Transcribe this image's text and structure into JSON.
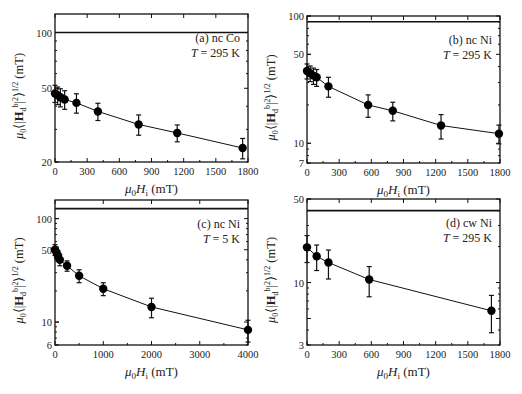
{
  "figure": {
    "ylabel": "μ0⟨|Hd^b|²⟩^1/2 (mT)",
    "xlabel": "μ0Hi (mT)"
  },
  "chart_data": [
    {
      "id": "a",
      "type": "line",
      "annotation_line1": "(a) nc Co",
      "annotation_line2": "T = 295 K",
      "xlabel": "μ0Hi (mT)",
      "ylabel": "μ0⟨|Hd^b|²⟩^1/2 (mT)",
      "yscale": "log",
      "xlim": [
        0,
        1800
      ],
      "ylim": [
        20,
        100
      ],
      "top_line_value": 100,
      "xticks": [
        0,
        300,
        600,
        900,
        1200,
        1500,
        1800
      ],
      "yticks": [
        20,
        50,
        100
      ],
      "x": [
        0,
        25,
        50,
        90,
        200,
        400,
        780,
        1140,
        1750
      ],
      "values": [
        46.9,
        45.8,
        44.7,
        43.5,
        41.7,
        37.5,
        31.9,
        28.7,
        23.8
      ],
      "err": [
        5,
        5,
        5,
        5,
        5,
        4,
        4,
        3,
        3
      ],
      "grid": false
    },
    {
      "id": "b",
      "type": "line",
      "annotation_line1": "(b) nc Ni",
      "annotation_line2": "T = 295 K",
      "xlabel": "μ0Hi (mT)",
      "ylabel": "μ0⟨|Hd^b|²⟩^1/2 (mT)",
      "yscale": "log",
      "xlim": [
        0,
        1800
      ],
      "ylim": [
        7,
        100
      ],
      "top_line_value": 90,
      "xticks": [
        0,
        300,
        600,
        900,
        1200,
        1500,
        1800
      ],
      "yticks": [
        7,
        10,
        50,
        100
      ],
      "x": [
        0,
        30,
        60,
        90,
        200,
        570,
        800,
        1250,
        1790
      ],
      "values": [
        37,
        35.5,
        34,
        33,
        28,
        20,
        18,
        13.8,
        11.9
      ],
      "err": [
        5,
        5,
        5,
        5,
        5,
        4,
        3,
        3,
        2
      ],
      "grid": false
    },
    {
      "id": "c",
      "type": "line",
      "annotation_line1": "(c) nc Ni",
      "annotation_line2": "T = 5 K",
      "xlabel": "μ0Hi (mT)",
      "ylabel": "μ0⟨|Hd^b|²⟩^1/2 (mT)",
      "yscale": "log",
      "xlim": [
        0,
        4000
      ],
      "ylim": [
        6,
        150
      ],
      "top_line_value": 125,
      "xticks": [
        0,
        1000,
        2000,
        3000,
        4000
      ],
      "yticks": [
        6,
        10,
        50,
        100
      ],
      "x": [
        0,
        30,
        60,
        100,
        250,
        500,
        1000,
        2000,
        4000
      ],
      "values": [
        50,
        47,
        44,
        40,
        35,
        28,
        21,
        14,
        8.4
      ],
      "err": [
        6,
        6,
        5,
        5,
        4,
        4,
        3,
        3,
        2
      ],
      "grid": false
    },
    {
      "id": "d",
      "type": "line",
      "annotation_line1": "(d) cw Ni",
      "annotation_line2": "T = 295 K",
      "xlabel": "μ0Hi (mT)",
      "ylabel": "μ0⟨|Hd^b|²⟩^1/2 (mT)",
      "yscale": "log",
      "xlim": [
        0,
        1800
      ],
      "ylim": [
        3,
        50
      ],
      "top_line_value": 40,
      "xticks": [
        0,
        300,
        600,
        900,
        1200,
        1500,
        1800
      ],
      "yticks": [
        3,
        10,
        50
      ],
      "x": [
        0,
        90,
        200,
        580,
        1720
      ],
      "values": [
        19.7,
        16.6,
        14.7,
        10.6,
        5.8
      ],
      "err": [
        5,
        4,
        4,
        3,
        2
      ],
      "grid": false
    }
  ],
  "layout": [
    {
      "left": 55,
      "top": 14,
      "right": 248,
      "bottom": 162,
      "ylog_top": 2.1
    },
    {
      "left": 307,
      "top": 16,
      "right": 500,
      "bottom": 163,
      "ylog_top": 2.0
    },
    {
      "left": 55,
      "top": 200,
      "right": 248,
      "bottom": 345,
      "ylog_top": 2.18
    },
    {
      "left": 307,
      "top": 199,
      "right": 500,
      "bottom": 345,
      "ylog_top": 1.699
    }
  ]
}
